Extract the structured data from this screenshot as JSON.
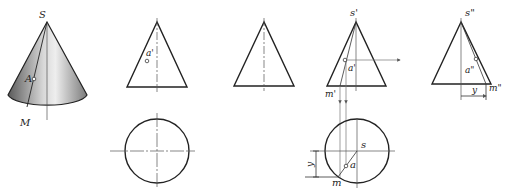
{
  "figure": {
    "colors": {
      "line": "#222222",
      "axis": "#555555",
      "projection": "#777777",
      "cone_dark": "#6a6a6a",
      "cone_light": "#e8e8e8"
    }
  },
  "pictorial": {
    "apex_label": "S",
    "point_label": "A",
    "base_point_label": "M"
  },
  "view1_front": {
    "point_label": "a'"
  },
  "view3_front": {
    "apex_label": "s'",
    "point_label": "a'",
    "base_point_label": "m'"
  },
  "view3_side": {
    "apex_label": "s\"",
    "point_label": "a\"",
    "base_point_label": "m\"",
    "dimension_label": "y"
  },
  "view3_top": {
    "center_label": "s",
    "point_label": "a",
    "base_point_label": "m",
    "dimension_label": "y"
  }
}
